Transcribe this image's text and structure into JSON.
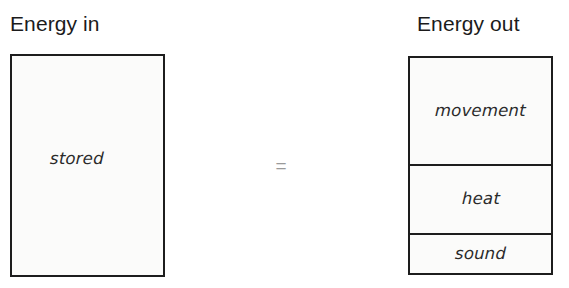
{
  "diagram": {
    "equals_symbol": "=",
    "input": {
      "heading": "Energy in",
      "segments": [
        {
          "label": "stored",
          "share_percent": 100
        }
      ]
    },
    "output": {
      "heading": "Energy out",
      "segments": [
        {
          "label": "movement",
          "share_percent": 50
        },
        {
          "label": "heat",
          "share_percent": 32
        },
        {
          "label": "sound",
          "share_percent": 18
        }
      ]
    }
  },
  "colors": {
    "ink": "#1d1d1d",
    "fill": "#fbfbfa",
    "heading_text": "#1b1b1b",
    "label_text": "#2a2a2a",
    "equals_text": "#9a9a9a"
  }
}
